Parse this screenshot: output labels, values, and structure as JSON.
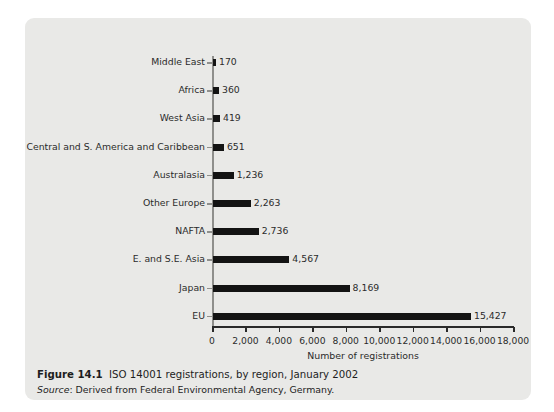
{
  "figure": {
    "caption_figure_number": "Figure 14.1",
    "caption_title": "ISO 14001 registrations, by region, January 2002",
    "source_word": "Source",
    "source_text": ": Derived from Federal Environmental Agency, Germany."
  },
  "colors": {
    "panel_background": "#e9e9e7",
    "page_background": "#ffffff",
    "bar_fill": "#131313",
    "axis": "#2a2a2a",
    "y_axis": "#8f8f8c",
    "text": "#2b2b2b"
  },
  "chart_data": {
    "type": "bar",
    "orientation": "horizontal",
    "title": "ISO 14001 registrations, by region, January 2002",
    "xlabel": "Number of registrations",
    "ylabel": "",
    "xlim": [
      0,
      18000
    ],
    "xticks": [
      0,
      2000,
      4000,
      6000,
      8000,
      10000,
      12000,
      14000,
      16000,
      18000
    ],
    "xtick_labels": [
      "0",
      "2,000",
      "4,000",
      "6,000",
      "8,000",
      "10,000",
      "12,000",
      "14,000",
      "16,000",
      "18,000"
    ],
    "grid": false,
    "legend": null,
    "data_labels": true,
    "categories": [
      "Middle East",
      "Africa",
      "West Asia",
      "Central and S. America and Caribbean",
      "Australasia",
      "Other Europe",
      "NAFTA",
      "E. and S.E. Asia",
      "Japan",
      "EU"
    ],
    "values": [
      170,
      360,
      419,
      651,
      1236,
      2263,
      2736,
      4567,
      8169,
      15427
    ],
    "value_labels": [
      "170",
      "360",
      "419",
      "651",
      "1,236",
      "2,263",
      "2,736",
      "4,567",
      "8,169",
      "15,427"
    ]
  }
}
